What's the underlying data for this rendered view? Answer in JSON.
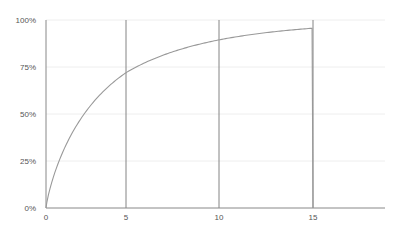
{
  "chart_data": {
    "type": "line",
    "title": "",
    "xlabel": "",
    "ylabel": "",
    "x_ticks": [
      "0",
      "5",
      "10",
      "15"
    ],
    "y_ticks": [
      "0%",
      "25%",
      "50%",
      "75%",
      "100%"
    ],
    "xlim": [
      0,
      19
    ],
    "ylim": [
      0,
      100
    ],
    "grid": {
      "horizontal": true,
      "vertical_lines_at": [
        5,
        10,
        15
      ]
    },
    "legend": null,
    "series": [
      {
        "name": "cumulative",
        "x": [
          0,
          0.5,
          1,
          2,
          3,
          4,
          5,
          6,
          7,
          8,
          9,
          10,
          11,
          12,
          13,
          14,
          15,
          15
        ],
        "values": [
          0,
          14,
          25,
          42,
          54,
          64,
          72,
          79,
          84,
          88,
          92,
          95,
          97,
          98,
          99,
          99,
          99,
          0
        ]
      }
    ],
    "colors": {
      "curve": "#999999",
      "axis": "#888888",
      "vline": "#777777",
      "grid": "#eeeeee"
    }
  }
}
